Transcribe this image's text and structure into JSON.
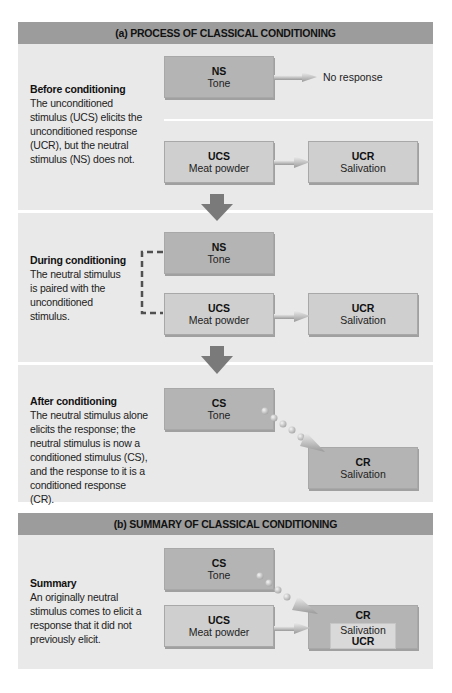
{
  "figure": {
    "section_a": {
      "header": "(a) PROCESS OF CLASSICAL CONDITIONING",
      "before": {
        "title": "Before conditioning",
        "text": "The unconditioned stimulus (UCS)  elicits the unconditioned response (UCR), but the neutral stimulus (NS) does not.",
        "ns_box": {
          "abbr": "NS",
          "name": "Tone"
        },
        "no_response": "No response",
        "ucs_box": {
          "abbr": "UCS",
          "name": "Meat powder"
        },
        "ucr_box": {
          "abbr": "UCR",
          "name": "Salivation"
        }
      },
      "during": {
        "title": "During conditioning",
        "text": "The neutral stimulus is paired with the unconditioned stimulus.",
        "ns_box": {
          "abbr": "NS",
          "name": "Tone"
        },
        "ucs_box": {
          "abbr": "UCS",
          "name": "Meat powder"
        },
        "ucr_box": {
          "abbr": "UCR",
          "name": "Salivation"
        }
      },
      "after": {
        "title": "After conditioning",
        "text": "The neutral stimulus alone elicits the response; the neutral stimulus is now a conditioned stimulus (CS), and the response to it is a conditioned response (CR).",
        "cs_box": {
          "abbr": "CS",
          "name": "Tone"
        },
        "cr_box": {
          "abbr": "CR",
          "name": "Salivation"
        }
      }
    },
    "section_b": {
      "header": "(b) SUMMARY OF CLASSICAL CONDITIONING",
      "summary": {
        "title": "Summary",
        "text": "An originally neutral stimulus comes to elicit a response that it did not previously elicit.",
        "cs_box": {
          "abbr": "CS",
          "name": "Tone"
        },
        "ucs_box": {
          "abbr": "UCS",
          "name": "Meat powder"
        },
        "cr_box": {
          "abbr": "CR",
          "inner_name": "Salivation",
          "inner_abbr": "UCR"
        }
      }
    },
    "colors": {
      "header_bg": "#9c9c9c",
      "panel_bg": "#e9e9e9",
      "box_dark": "#b4b4b4",
      "box_light": "#cfcfcf",
      "arrow_fill": "#7a7a7a"
    }
  }
}
